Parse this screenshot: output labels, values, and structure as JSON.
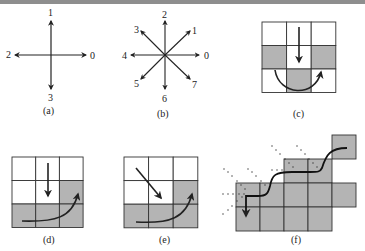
{
  "figure": {
    "panels": [
      {
        "id": "a",
        "caption": "(a)",
        "type": "direction-code-4",
        "directions": [
          "0",
          "1",
          "2",
          "3"
        ]
      },
      {
        "id": "b",
        "caption": "(b)",
        "type": "direction-code-8",
        "directions": [
          "0",
          "1",
          "2",
          "3",
          "4",
          "5",
          "6",
          "7"
        ]
      },
      {
        "id": "c",
        "caption": "(c)",
        "type": "3x3-grid",
        "shaded_cells": [
          [
            1,
            0
          ],
          [
            1,
            2
          ],
          [
            2,
            1
          ]
        ],
        "arrows": [
          "down-center",
          "curved-left-to-right"
        ]
      },
      {
        "id": "d",
        "caption": "(d)",
        "type": "3x3-grid",
        "shaded_cells": [
          [
            1,
            2
          ],
          [
            2,
            0
          ],
          [
            2,
            1
          ],
          [
            2,
            2
          ]
        ],
        "arrows": [
          "down-center",
          "curved-bottom-to-right"
        ]
      },
      {
        "id": "e",
        "caption": "(e)",
        "type": "3x3-grid",
        "shaded_cells": [
          [
            1,
            2
          ],
          [
            2,
            0
          ],
          [
            2,
            1
          ],
          [
            2,
            2
          ]
        ],
        "arrows": [
          "diagonal-down-right",
          "curved-bottom-to-right"
        ]
      },
      {
        "id": "f",
        "caption": "(f)",
        "type": "staircase-boundary-trace"
      }
    ],
    "colors": {
      "shade": "#b4b4b4",
      "line": "#222222",
      "band": "#8e8e8e"
    }
  }
}
